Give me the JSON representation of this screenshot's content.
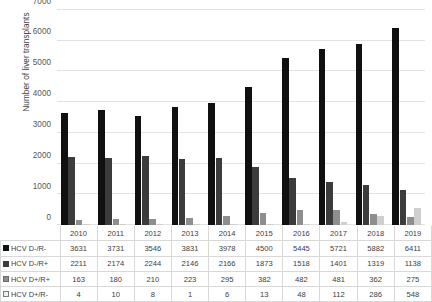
{
  "chart_data": {
    "type": "bar",
    "title": "",
    "xlabel": "",
    "ylabel": "Number of liver transplants",
    "ylim": [
      0,
      7000
    ],
    "yticks": [
      0,
      1000,
      2000,
      3000,
      4000,
      5000,
      6000,
      7000
    ],
    "grid": true,
    "legend_position": "data-table",
    "categories": [
      "2010",
      "2011",
      "2012",
      "2013",
      "2014",
      "2015",
      "2016",
      "2017",
      "2018",
      "2019"
    ],
    "series": [
      {
        "name": "HCV D-/R-",
        "color": "#101010",
        "swatch": "filled-black-square-icon",
        "values": [
          3631,
          3731,
          3546,
          3831,
          3978,
          4500,
          5445,
          5721,
          5882,
          6411
        ]
      },
      {
        "name": "HCV D-/R+",
        "color": "#3c3c3c",
        "swatch": "filled-dark-gray-square-icon",
        "values": [
          2211,
          2174,
          2244,
          2146,
          2166,
          1873,
          1518,
          1401,
          1319,
          1138
        ]
      },
      {
        "name": "HCV D+/R+",
        "color": "#8e8e8e",
        "swatch": "filled-gray-square-icon",
        "values": [
          163,
          180,
          210,
          223,
          295,
          382,
          482,
          481,
          362,
          275
        ]
      },
      {
        "name": "HCV D+/R-",
        "color": "#cfcfcf",
        "swatch": "outlined-light-square-icon",
        "values": [
          4,
          10,
          8,
          1,
          6,
          13,
          48,
          112,
          286,
          548
        ]
      }
    ]
  },
  "table": {
    "corner_label": "",
    "column_headers": [
      "2010",
      "2011",
      "2012",
      "2013",
      "2014",
      "2015",
      "2016",
      "2017",
      "2018",
      "2019"
    ],
    "rows": [
      {
        "label": "HCV D-/R-",
        "values": [
          "3631",
          "3731",
          "3546",
          "3831",
          "3978",
          "4500",
          "5445",
          "5721",
          "5882",
          "6411"
        ]
      },
      {
        "label": "HCV D-/R+",
        "values": [
          "2211",
          "2174",
          "2244",
          "2146",
          "2166",
          "1873",
          "1518",
          "1401",
          "1319",
          "1138"
        ]
      },
      {
        "label": "HCV D+/R+",
        "values": [
          "163",
          "180",
          "210",
          "223",
          "295",
          "382",
          "482",
          "481",
          "362",
          "275"
        ]
      },
      {
        "label": "HCV D+/R-",
        "values": [
          "4",
          "10",
          "8",
          "1",
          "6",
          "13",
          "48",
          "112",
          "286",
          "548"
        ]
      }
    ]
  }
}
